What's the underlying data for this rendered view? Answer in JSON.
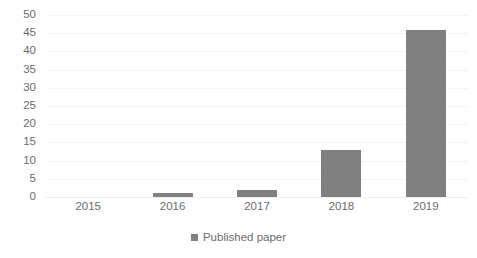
{
  "chart_data": {
    "type": "bar",
    "title": "",
    "subtitle": "",
    "xlabel": "",
    "ylabel": "",
    "categories": [
      "2015",
      "2016",
      "2017",
      "2018",
      "2019"
    ],
    "series": [
      {
        "name": "Published paper",
        "values": [
          0,
          1,
          2,
          13,
          46
        ],
        "color": "#808080"
      }
    ],
    "ylim": [
      0,
      50
    ],
    "ytick_labels": [
      "50",
      "45",
      "40",
      "35",
      "30",
      "25",
      "20",
      "15",
      "10",
      "5",
      "0"
    ],
    "ytick_values": [
      50,
      45,
      40,
      35,
      30,
      25,
      20,
      15,
      10,
      5,
      0
    ],
    "ytick_step": 5,
    "grid": true,
    "grid_axis": "y",
    "grid_color": "#f4f4f4",
    "legend": {
      "position": "bottom",
      "entries": [
        {
          "label": "Published paper",
          "marker": "square",
          "color": "#808080"
        }
      ]
    },
    "background_color": "#ffffff",
    "axis_text_color": "#6b6b6b"
  }
}
